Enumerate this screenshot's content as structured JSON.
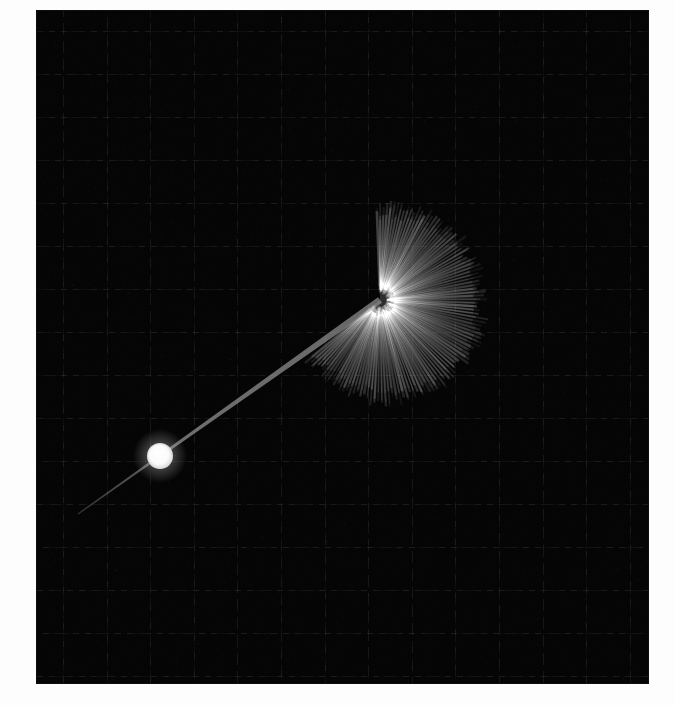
{
  "figure": {
    "background_color": "#fdfdfd",
    "plot": {
      "x": 37,
      "y": 11,
      "width": 611,
      "height": 672,
      "background_color": "#050505",
      "border_color": "#0d0d0d"
    },
    "grid": {
      "visible": true,
      "color": "#1f1f1f",
      "line_width": 1,
      "spacing_x": 43.6,
      "spacing_y": 43.0,
      "offset_x": 26,
      "offset_y": 20,
      "columns": 14,
      "rows": 16
    }
  },
  "chart_data": {
    "type": "scatter",
    "title": "",
    "subtitle": "",
    "xlabel": "",
    "ylabel": "",
    "grid": true,
    "legend": null,
    "xlim": [
      0,
      675
    ],
    "ylim": [
      0,
      705
    ],
    "annotations": [],
    "objects": [
      {
        "name": "particle",
        "kind": "filled-circle",
        "cx": 160,
        "cy": 456,
        "r": 13,
        "color": "#fafafa",
        "edge_color": "#ffffff",
        "opacity": 1
      },
      {
        "name": "trajectory-tail",
        "kind": "tapered-line",
        "x1": 78,
        "y1": 514,
        "x2": 380,
        "y2": 300,
        "width_start": 1,
        "width_end": 7,
        "color": "#8e8e8e",
        "opacity": 0.85
      },
      {
        "name": "radial-burst",
        "kind": "ray-fan",
        "cx": 380,
        "cy": 300,
        "ray_count": 110,
        "angle_start_deg": -92,
        "angle_end_deg": 140,
        "radius_min": 72,
        "radius_max": 96,
        "radius_jitter": 14,
        "ray_width": 2.1,
        "color": "#7f7f7f",
        "opacity": 0.5,
        "bounds": {
          "left": 318,
          "top": 205,
          "right": 470,
          "bottom": 390
        }
      }
    ],
    "series": [
      {
        "name": "burst-rays",
        "description": "Radial rays emitted from burst center",
        "center": [
          380,
          300
        ],
        "count": 110,
        "angles_deg_range": [
          -92,
          140
        ],
        "radii_range": [
          72,
          110
        ]
      }
    ],
    "values": [],
    "categories": []
  }
}
